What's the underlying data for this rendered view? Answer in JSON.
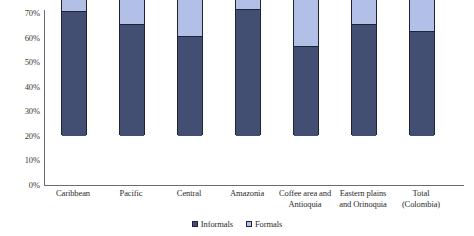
{
  "chart_data": {
    "type": "bar",
    "subtype": "stacked-column",
    "title": "",
    "subtitle": "",
    "xlabel": "",
    "ylabel": "",
    "ylim": [
      0,
      70
    ],
    "y_tick_labels": [
      "70%",
      "60%",
      "50%",
      "40%",
      "30%",
      "20%",
      "10%",
      "0%"
    ],
    "y_tick_values": [
      70,
      60,
      50,
      40,
      30,
      20,
      10,
      0
    ],
    "y_tick_step": 10,
    "grid": false,
    "legend_position": "bottom-center",
    "categories": [
      "Caribbean",
      "Pacific",
      "Central",
      "Amazonia",
      "Coffee area and Antioquia",
      "Eastern plains and Orinoquia",
      "Total (Colombia)"
    ],
    "category_lines": [
      [
        "Caribbean"
      ],
      [
        "Pacific"
      ],
      [
        "Central"
      ],
      [
        "Amazonia"
      ],
      [
        "Coffee area and",
        "Antioquia"
      ],
      [
        "Eastern plains",
        "and Orinoquia"
      ],
      [
        "Total",
        "(Colombia)"
      ]
    ],
    "series": [
      {
        "name": "Informals",
        "color": "#424f72",
        "values": [
          50,
          45,
          40,
          51,
          36,
          45,
          42
        ]
      },
      {
        "name": "Formals",
        "color": "#b2bfe6",
        "values": [
          10,
          13,
          20,
          6,
          24,
          14.5,
          18
        ]
      }
    ],
    "totals": [
      60,
      58,
      60,
      57,
      60,
      59.5,
      60
    ],
    "colors": {
      "informals": "#424f72",
      "formals": "#b2bfe6",
      "bar_outline": "#1d2436",
      "axis": "#6c6c6c",
      "text": "#2b2b2b",
      "background": "#ffffff"
    }
  },
  "legend": {
    "items": [
      {
        "label": "Informals",
        "swatch": "legend-swatch-informals"
      },
      {
        "label": "Formals",
        "swatch": "legend-swatch-formals"
      }
    ]
  }
}
